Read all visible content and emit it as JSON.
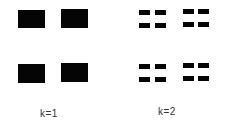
{
  "panels": [
    {
      "label": "k=1",
      "blocks": [
        {
          "x": 18,
          "y": 10,
          "w": 27,
          "h": 18
        },
        {
          "x": 61,
          "y": 9,
          "w": 27,
          "h": 19
        },
        {
          "x": 18,
          "y": 64,
          "w": 27,
          "h": 19
        },
        {
          "x": 61,
          "y": 63,
          "w": 27,
          "h": 19
        }
      ]
    },
    {
      "label": "k=2",
      "blocks": [
        {
          "x": 139,
          "y": 10,
          "w": 11,
          "h": 5
        },
        {
          "x": 155,
          "y": 10,
          "w": 11,
          "h": 5
        },
        {
          "x": 139,
          "y": 23,
          "w": 11,
          "h": 5
        },
        {
          "x": 155,
          "y": 23,
          "w": 11,
          "h": 5
        },
        {
          "x": 183,
          "y": 9,
          "w": 11,
          "h": 5
        },
        {
          "x": 198,
          "y": 9,
          "w": 11,
          "h": 5
        },
        {
          "x": 183,
          "y": 22,
          "w": 11,
          "h": 5
        },
        {
          "x": 198,
          "y": 22,
          "w": 11,
          "h": 5
        },
        {
          "x": 139,
          "y": 64,
          "w": 11,
          "h": 5
        },
        {
          "x": 155,
          "y": 64,
          "w": 11,
          "h": 5
        },
        {
          "x": 139,
          "y": 77,
          "w": 11,
          "h": 5
        },
        {
          "x": 155,
          "y": 77,
          "w": 11,
          "h": 5
        },
        {
          "x": 183,
          "y": 63,
          "w": 11,
          "h": 5
        },
        {
          "x": 198,
          "y": 63,
          "w": 11,
          "h": 5
        },
        {
          "x": 183,
          "y": 76,
          "w": 11,
          "h": 5
        },
        {
          "x": 198,
          "y": 76,
          "w": 11,
          "h": 5
        }
      ]
    }
  ]
}
